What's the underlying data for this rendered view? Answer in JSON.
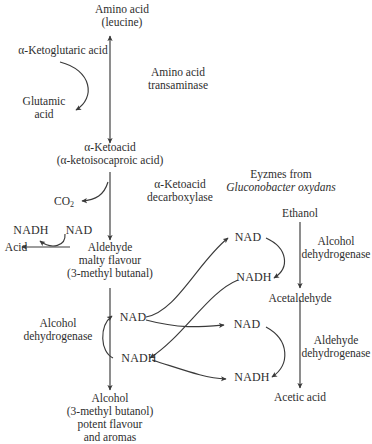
{
  "diagram": {
    "type": "biochemical-pathway",
    "width": 372,
    "height": 444,
    "background": "#ffffff",
    "stroke_color": "#3a3a3a",
    "text_color": "#2e2e2e"
  },
  "metabolites": {
    "amino_acid": {
      "line1": "Amino acid",
      "line2": "(leucine)"
    },
    "ketoglutaric_acid": {
      "label": "α-Ketoglutaric acid"
    },
    "glutamic_acid": {
      "line1": "Glutamic",
      "line2": "acid"
    },
    "ketoacid": {
      "line1": "α-Ketoacid",
      "line2": "(α-ketoisocaproic acid)"
    },
    "carbon_dioxide": {
      "label": "CO",
      "subscript": "2"
    },
    "aldehyde": {
      "line1": "Aldehyde",
      "line2": "malty flavour",
      "line3": "(3-methyl butanal)"
    },
    "acid": {
      "label": "Acid"
    },
    "alcohol": {
      "line1": "Alcohol",
      "line2": "(3-methyl butanol)",
      "line3": "potent flavour",
      "line4": "and aromas"
    },
    "ethanol": {
      "label": "Ethanol"
    },
    "acetaldehyde": {
      "label": "Acetaldehyde"
    },
    "acetic_acid": {
      "label": "Acetic acid"
    }
  },
  "enzymes": {
    "transaminase": {
      "line1": "Amino acid",
      "line2": "transaminase"
    },
    "decarboxylase": {
      "line1": "α-Ketoacid",
      "line2": "decarboxylase"
    },
    "alcohol_dehydrogenase_left": {
      "line1": "Alcohol",
      "line2": "dehydrogenase"
    },
    "alcohol_dehydrogenase_right": {
      "line1": "Alcohol",
      "line2": "dehydrogenase"
    },
    "aldehyde_dehydrogenase_right": {
      "line1": "Aldehyde",
      "line2": "dehydrogenase"
    }
  },
  "annotations": {
    "enzyme_source": {
      "line1": "Eyzmes from",
      "line2": "Gluconobacter oxydans"
    }
  },
  "cofactors": {
    "nadh_acid_branch": "NADH",
    "nad_acid_branch": "NAD",
    "nad_alcohol_branch": "NAD",
    "nadh_alcohol_branch": "NADH",
    "nad_ethanol_branch": "NAD",
    "nadh_ethanol_branch": "NADH",
    "nad_acetaldehyde_branch": "NAD",
    "nadh_acetaldehyde_branch": "NADH"
  }
}
